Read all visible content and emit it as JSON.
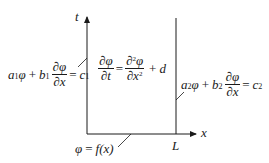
{
  "diagram": {
    "type": "pde-boundary-value-problem",
    "axes": {
      "vertical_label": "t",
      "horizontal_label": "x",
      "right_boundary_label": "L"
    },
    "equations": {
      "governing": {
        "lhs_num": "∂φ",
        "lhs_den": "∂t",
        "eq": "=",
        "rhs_num_d": "∂",
        "rhs_num_sup": "2",
        "rhs_num_var": "φ",
        "rhs_den_d": "∂x",
        "rhs_den_sup": "2",
        "plus": "+",
        "term": "d"
      },
      "left_boundary": {
        "a": "a",
        "a_sub": "1",
        "phi": "φ",
        "plus": "+",
        "b": "b",
        "b_sub": "1",
        "frac_num": "∂φ",
        "frac_den": "∂x",
        "eq": "=",
        "c": "c",
        "c_sub": "1"
      },
      "right_boundary": {
        "a": "a",
        "a_sub": "2",
        "phi": "φ",
        "plus": "+",
        "b": "b",
        "b_sub": "2",
        "frac_num": "∂φ",
        "frac_den": "∂x",
        "eq": "=",
        "c": "c",
        "c_sub": "2"
      },
      "initial_condition": {
        "phi": "φ",
        "eq": "=",
        "f": "f",
        "arg": "(x)"
      }
    },
    "colors": {
      "ink": "#1a1a1a",
      "background": "#ffffff"
    }
  }
}
